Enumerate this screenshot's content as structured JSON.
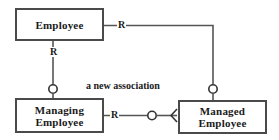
{
  "diagram": {
    "title": "a new association",
    "type": "entity-relationship-diagram",
    "colors": {
      "background": "#ffffff",
      "box_border": "#4a4a4a",
      "line": "#555555",
      "text": "#1a1a1a"
    },
    "entities": [
      {
        "id": "employee",
        "label": "Employee"
      },
      {
        "id": "managing_employee",
        "label": "Managing\nEmployee"
      },
      {
        "id": "managed_employee",
        "label": "Managed\nEmployee"
      }
    ],
    "edges": [
      {
        "id": "employee-to-managed",
        "from": "employee",
        "to": "managed_employee",
        "label": "R",
        "source_marker": "none",
        "target_marker": "circle"
      },
      {
        "id": "employee-to-managing",
        "from": "employee",
        "to": "managing_employee",
        "label": "R",
        "source_marker": "none",
        "target_marker": "circle"
      },
      {
        "id": "managing-to-managed",
        "from": "managing_employee",
        "to": "managed_employee",
        "label": "R",
        "source_marker": "none",
        "mid_marker": "circle",
        "target_marker": "arc"
      }
    ],
    "caption": "a new association"
  }
}
